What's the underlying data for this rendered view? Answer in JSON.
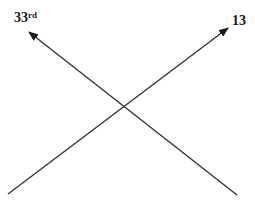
{
  "diagram": {
    "type": "crossing-arrows",
    "line_color": "#333333",
    "labels": {
      "left_arrow": {
        "main": "33",
        "superscript": "rd"
      },
      "right_arrow": {
        "main": "13"
      }
    },
    "arrows": [
      {
        "name": "left-up-arrow",
        "from": [
          237,
          195
        ],
        "to": [
          29,
          32
        ]
      },
      {
        "name": "right-up-arrow",
        "from": [
          8,
          194
        ],
        "to": [
          228,
          28
        ]
      }
    ]
  }
}
